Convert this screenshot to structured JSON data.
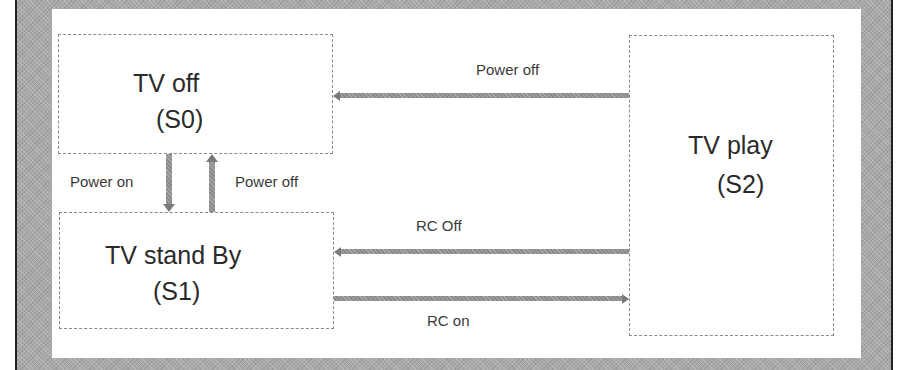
{
  "diagram": {
    "type": "state-transition",
    "states": [
      {
        "id": "S0",
        "name": "TV off",
        "code": "(S0)"
      },
      {
        "id": "S1",
        "name": "TV stand By",
        "code": "(S1)"
      },
      {
        "id": "S2",
        "name": "TV play",
        "code": "(S2)"
      }
    ],
    "transitions": [
      {
        "from": "S2",
        "to": "S0",
        "label": "Power off"
      },
      {
        "from": "S0",
        "to": "S1",
        "label": "Power on"
      },
      {
        "from": "S1",
        "to": "S0",
        "label": "Power off"
      },
      {
        "from": "S2",
        "to": "S1",
        "label": "RC Off"
      },
      {
        "from": "S1",
        "to": "S2",
        "label": "RC on"
      }
    ]
  },
  "colors": {
    "frame": "#a9a9a9",
    "arrow": "#8c8c8c",
    "box_border": "#8a8a8a",
    "text": "#2a2a2a"
  }
}
